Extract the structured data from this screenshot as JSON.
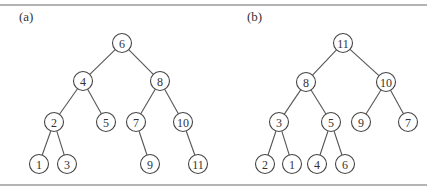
{
  "panels": [
    {
      "id": "a",
      "label": "(a)",
      "nodes": [
        {
          "id": "a6",
          "value": "6",
          "parent": null
        },
        {
          "id": "a4",
          "value": "4",
          "parent": "a6"
        },
        {
          "id": "a8",
          "value": "8",
          "parent": "a6"
        },
        {
          "id": "a2",
          "value": "2",
          "parent": "a4"
        },
        {
          "id": "a5",
          "value": "5",
          "parent": "a4"
        },
        {
          "id": "a7",
          "value": "7",
          "parent": "a8"
        },
        {
          "id": "a10",
          "value": "10",
          "parent": "a8"
        },
        {
          "id": "a1",
          "value": "1",
          "parent": "a2"
        },
        {
          "id": "a3",
          "value": "3",
          "parent": "a2"
        },
        {
          "id": "a9",
          "value": "9",
          "parent": "a7"
        },
        {
          "id": "a11",
          "value": "11",
          "parent": "a10"
        }
      ]
    },
    {
      "id": "b",
      "label": "(b)",
      "nodes": [
        {
          "id": "b11",
          "value": "11",
          "parent": null
        },
        {
          "id": "b8",
          "value": "8",
          "parent": "b11"
        },
        {
          "id": "b10",
          "value": "10",
          "parent": "b11"
        },
        {
          "id": "b3",
          "value": "3",
          "parent": "b8"
        },
        {
          "id": "b5",
          "value": "5",
          "parent": "b8"
        },
        {
          "id": "b9",
          "value": "9",
          "parent": "b10"
        },
        {
          "id": "b7",
          "value": "7",
          "parent": "b10"
        },
        {
          "id": "b2",
          "value": "2",
          "parent": "b3"
        },
        {
          "id": "b1",
          "value": "1",
          "parent": "b3"
        },
        {
          "id": "b4",
          "value": "4",
          "parent": "b5"
        },
        {
          "id": "b6",
          "value": "6",
          "parent": "b5"
        }
      ]
    }
  ]
}
